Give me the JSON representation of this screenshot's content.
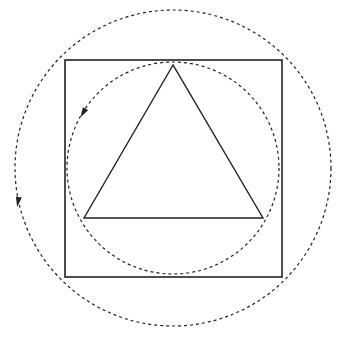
{
  "diagram": {
    "stroke_color": "#222222",
    "background": "#ffffff",
    "square": {
      "x": 65,
      "y": 60,
      "size": 217
    },
    "inner_circle": {
      "cx": 173,
      "cy": 168,
      "r": 106,
      "style": "dashed"
    },
    "outer_circle": {
      "cx": 173,
      "cy": 168,
      "r": 158,
      "style": "dashed"
    },
    "triangle": {
      "points": "173,65 84,218 263,218"
    },
    "arrows": [
      {
        "name": "inner-circle-direction-arrow",
        "x": 83,
        "y": 113,
        "angle": 120
      },
      {
        "name": "outer-circle-direction-arrow",
        "x": 18,
        "y": 202,
        "angle": 100
      }
    ]
  }
}
